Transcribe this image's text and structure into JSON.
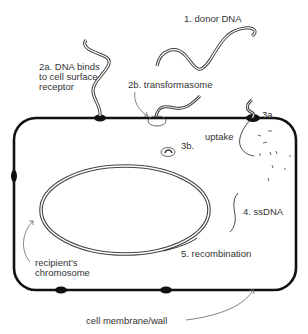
{
  "labels": {
    "step1": "1. donor DNA",
    "step2a_line1": "2a. DNA binds",
    "step2a_line2": "to cell surface",
    "step2a_line3": "receptor",
    "step2b": "2b. transformasome",
    "step3a": "3a.",
    "step3b": "3b.",
    "uptake": "uptake",
    "step4": "4. ssDNA",
    "step5": "5. recombination",
    "chromosome_line1": "recipient's",
    "chromosome_line2": "chromosome",
    "membrane": "cell membrane/wall"
  },
  "colors": {
    "outline": "#111111",
    "dna": "#555555",
    "text": "#333333",
    "background": "#ffffff"
  }
}
